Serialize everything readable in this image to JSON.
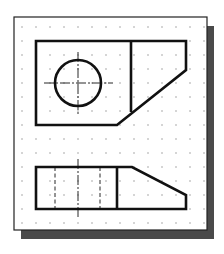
{
  "figure": {
    "background": "#ffffff",
    "paper": {
      "x": 14,
      "y": 17,
      "width": 193,
      "height": 213,
      "fill": "#ffffff",
      "stroke": "#222222",
      "stroke_width": 1.2
    },
    "shadow": {
      "offset_x": 7,
      "offset_y": 9,
      "fill": "#4a4a4a"
    },
    "grid": {
      "dot_color": "#8a8a8a",
      "dot_radius": 0.7,
      "start_x": 22,
      "start_y": 27,
      "spacing": 14,
      "cols": 14,
      "rows": 15
    },
    "line_color": "#111111",
    "object_line_width": 2.6,
    "thin_line_width": 0.9,
    "top_view": {
      "name": "top-view",
      "outline_points": [
        [
          36,
          41
        ],
        [
          186,
          41
        ],
        [
          186,
          70
        ],
        [
          117,
          125
        ],
        [
          36,
          125
        ]
      ],
      "inner_edge": {
        "x1": 131,
        "y1": 41,
        "x2": 131,
        "y2": 112
      },
      "hole": {
        "cx": 78,
        "cy": 83,
        "r": 23
      },
      "center_line_h": {
        "x1": 44,
        "y1": 83,
        "x2": 113,
        "y2": 83
      },
      "center_line_v": {
        "x1": 78,
        "y1": 52,
        "x2": 78,
        "y2": 115
      }
    },
    "front_view": {
      "name": "front-view",
      "outline_points": [
        [
          36,
          167
        ],
        [
          132,
          167
        ],
        [
          186,
          195
        ],
        [
          186,
          209
        ],
        [
          36,
          209
        ]
      ],
      "inner_edge": {
        "x1": 117,
        "y1": 167,
        "x2": 117,
        "y2": 209
      },
      "hidden_lines": [
        {
          "x1": 55,
          "y1": 167,
          "x2": 55,
          "y2": 209
        },
        {
          "x1": 100,
          "y1": 167,
          "x2": 100,
          "y2": 209
        }
      ],
      "center_line_v": {
        "x1": 78,
        "y1": 159,
        "x2": 78,
        "y2": 217
      }
    }
  }
}
